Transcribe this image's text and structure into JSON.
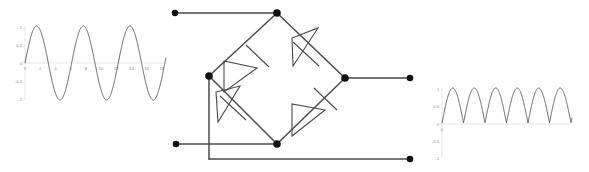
{
  "figure": {
    "title": ""
  },
  "input_chart": {
    "name": "input-waveform",
    "y_ticks": [
      "1",
      "0.5",
      "0",
      "-0.5",
      "-1"
    ],
    "x_ticks": [
      "0",
      "2",
      "4",
      "6",
      "8",
      "10",
      "12",
      "14",
      "16",
      "18"
    ],
    "curve_color": "#555555",
    "axis_color": "#d8d8d8"
  },
  "output_chart": {
    "name": "output-waveform",
    "y_ticks": [
      "1",
      "0.5",
      "0",
      "-0.5",
      "-1"
    ],
    "x_ticks": [
      "0"
    ],
    "curve_color": "#555555",
    "axis_color": "#d8d8d8"
  },
  "circuit": {
    "name": "bridge-rectifier",
    "wire_color": "#4a4a4a",
    "node_color": "#111111",
    "terminals": [
      {
        "id": "ac-input-top",
        "label": ""
      },
      {
        "id": "ac-input-bottom",
        "label": ""
      },
      {
        "id": "dc-output-positive",
        "label": ""
      },
      {
        "id": "dc-output-negative",
        "label": ""
      }
    ],
    "diodes": [
      {
        "id": "diode-top-left",
        "label": ""
      },
      {
        "id": "diode-top-right",
        "label": ""
      },
      {
        "id": "diode-bottom-left",
        "label": ""
      },
      {
        "id": "diode-bottom-right",
        "label": ""
      }
    ],
    "nodes": [
      {
        "id": "node-top",
        "label": ""
      },
      {
        "id": "node-left",
        "label": ""
      },
      {
        "id": "node-right",
        "label": ""
      },
      {
        "id": "node-bottom",
        "label": ""
      }
    ]
  },
  "chart_data": [
    {
      "type": "line",
      "name": "input-sine",
      "title": "",
      "xlabel": "",
      "ylabel": "",
      "xlim": [
        0,
        19
      ],
      "ylim": [
        -1,
        1
      ],
      "grid": false,
      "legend": "none",
      "xticks": [
        0,
        2,
        4,
        6,
        8,
        10,
        12,
        14,
        16,
        18
      ],
      "yticks": [
        -1,
        -0.5,
        0,
        0.5,
        1
      ],
      "series": [
        {
          "name": "sin(x)",
          "x": [
            0,
            0.5,
            1,
            1.5,
            2,
            2.5,
            3,
            3.5,
            4,
            4.5,
            5,
            5.5,
            6,
            6.5,
            7,
            7.5,
            8,
            8.5,
            9,
            9.5,
            10,
            10.5,
            11,
            11.5,
            12,
            12.5,
            13,
            13.5,
            14,
            14.5,
            15,
            15.5,
            16,
            16.5,
            17,
            17.5,
            18,
            18.5,
            19
          ],
          "y": [
            0,
            0.48,
            0.84,
            1,
            0.91,
            0.6,
            0.14,
            -0.35,
            -0.76,
            -0.98,
            -0.96,
            -0.71,
            -0.28,
            0.22,
            0.66,
            0.94,
            0.99,
            0.8,
            0.41,
            -0.08,
            -0.54,
            -0.88,
            -1,
            -0.89,
            -0.54,
            -0.07,
            0.42,
            0.8,
            0.99,
            0.93,
            0.65,
            0.21,
            -0.29,
            -0.71,
            -0.96,
            -0.98,
            -0.75,
            -0.34,
            0.15
          ]
        }
      ]
    },
    {
      "type": "line",
      "name": "rectified-output",
      "title": "",
      "xlabel": "",
      "ylabel": "",
      "xlim": [
        0,
        19
      ],
      "ylim": [
        -1,
        1
      ],
      "grid": false,
      "legend": "none",
      "xticks": [
        0
      ],
      "yticks": [
        -1,
        -0.5,
        0,
        0.5,
        1
      ],
      "series": [
        {
          "name": "abs(sin(x))",
          "x": [
            0,
            0.5,
            1,
            1.5,
            2,
            2.5,
            3,
            3.5,
            4,
            4.5,
            5,
            5.5,
            6,
            6.5,
            7,
            7.5,
            8,
            8.5,
            9,
            9.5,
            10,
            10.5,
            11,
            11.5,
            12,
            12.5,
            13,
            13.5,
            14,
            14.5,
            15,
            15.5,
            16,
            16.5,
            17,
            17.5,
            18,
            18.5,
            19
          ],
          "y": [
            0,
            0.48,
            0.84,
            1,
            0.91,
            0.6,
            0.14,
            0.35,
            0.76,
            0.98,
            0.96,
            0.71,
            0.28,
            0.22,
            0.66,
            0.94,
            0.99,
            0.8,
            0.41,
            0.08,
            0.54,
            0.88,
            1,
            0.89,
            0.54,
            0.07,
            0.42,
            0.8,
            0.99,
            0.93,
            0.65,
            0.21,
            0.29,
            0.71,
            0.96,
            0.98,
            0.75,
            0.34,
            0.15
          ]
        }
      ]
    }
  ]
}
